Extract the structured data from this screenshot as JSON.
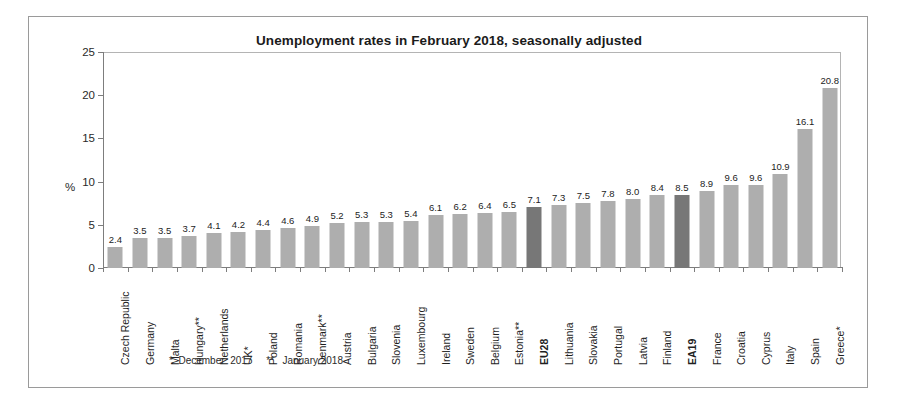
{
  "chart_data": {
    "type": "bar",
    "title": "Unemployment rates in February 2018, seasonally adjusted",
    "xlabel": "",
    "ylabel": "%",
    "ylim": [
      0,
      25
    ],
    "ytick_labels": [
      "25",
      "20",
      "15",
      "10",
      "5",
      "0"
    ],
    "yticks": [
      25,
      20,
      15,
      10,
      5,
      0
    ],
    "grid": false,
    "legend": "none",
    "highlight_color": "#777777",
    "bar_color": "#aeaeae",
    "highlighted_categories": [
      "EU28",
      "EA19"
    ],
    "categories": [
      "Czech Republic",
      "Germany",
      "Malta",
      "Hungary**",
      "Netherlands",
      "UK*",
      "Poland",
      "Romania",
      "Denmark**",
      "Austria",
      "Bulgaria",
      "Slovenia",
      "Luxembourg",
      "Ireland",
      "Sweden",
      "Belgium",
      "Estonia**",
      "EU28",
      "Lithuania",
      "Slovakia",
      "Portugal",
      "Latvia",
      "Finland",
      "EA19",
      "France",
      "Croatia",
      "Cyprus",
      "Italy",
      "Spain",
      "Greece*"
    ],
    "values": [
      2.4,
      3.5,
      3.5,
      3.7,
      4.1,
      4.2,
      4.4,
      4.6,
      4.9,
      5.2,
      5.3,
      5.3,
      5.4,
      6.1,
      6.2,
      6.4,
      6.5,
      7.1,
      7.3,
      7.5,
      7.8,
      8.0,
      8.4,
      8.5,
      8.9,
      9.6,
      9.6,
      10.9,
      16.1,
      20.8
    ],
    "value_labels": [
      "2.4",
      "3.5",
      "3.5",
      "3.7",
      "4.1",
      "4.2",
      "4.4",
      "4.6",
      "4.9",
      "5.2",
      "5.3",
      "5.3",
      "5.4",
      "6.1",
      "6.2",
      "6.4",
      "6.5",
      "7.1",
      "7.3",
      "7.5",
      "7.8",
      "8.0",
      "8.4",
      "8.5",
      "8.9",
      "9.6",
      "9.6",
      "10.9",
      "16.1",
      "20.8"
    ]
  },
  "footnote": "*  December  2017     **   January 2018"
}
